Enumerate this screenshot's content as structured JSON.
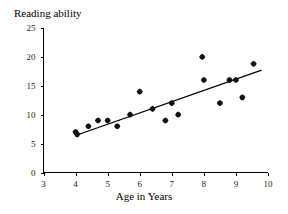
{
  "chart_data": {
    "type": "scatter",
    "title": "Reading ability",
    "xlabel": "Age in Years",
    "ylabel": "Reading ability",
    "xlim": [
      3,
      10
    ],
    "ylim": [
      0,
      25
    ],
    "xticks": [
      3,
      4,
      5,
      6,
      7,
      8,
      9,
      10
    ],
    "yticks": [
      0,
      5,
      10,
      15,
      20,
      25
    ],
    "grid": false,
    "legend": null,
    "marker": "filled-diamond",
    "marker_color": "#111111",
    "points": [
      {
        "x": 4.0,
        "y": 7.0
      },
      {
        "x": 4.05,
        "y": 6.6
      },
      {
        "x": 4.4,
        "y": 8.0
      },
      {
        "x": 4.7,
        "y": 9.0
      },
      {
        "x": 5.0,
        "y": 9.0
      },
      {
        "x": 5.3,
        "y": 8.0
      },
      {
        "x": 5.7,
        "y": 10.0
      },
      {
        "x": 6.0,
        "y": 14.0
      },
      {
        "x": 6.4,
        "y": 11.0
      },
      {
        "x": 6.8,
        "y": 9.0
      },
      {
        "x": 7.0,
        "y": 12.0
      },
      {
        "x": 7.2,
        "y": 10.0
      },
      {
        "x": 7.95,
        "y": 20.0
      },
      {
        "x": 8.0,
        "y": 16.0
      },
      {
        "x": 8.5,
        "y": 12.0
      },
      {
        "x": 8.8,
        "y": 16.0
      },
      {
        "x": 9.0,
        "y": 16.0
      },
      {
        "x": 9.2,
        "y": 13.0
      },
      {
        "x": 9.55,
        "y": 18.8
      }
    ],
    "trend_line": {
      "type": "linear-fit",
      "x_start": 4.0,
      "y_start": 6.4,
      "x_end": 9.8,
      "y_end": 17.7
    }
  }
}
